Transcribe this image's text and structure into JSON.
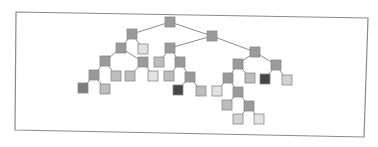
{
  "diagram": {
    "type": "binary-tree",
    "frame": {
      "corners": [
        [
          16,
          12
        ],
        [
          368,
          18
        ],
        [
          364,
          137
        ],
        [
          15,
          130
        ]
      ],
      "stroke": "#8a8a8a"
    },
    "node_size": 10,
    "edge_color": "#8c8c8c",
    "colors": {
      "medium": "#9a9a9a",
      "light_medium": "#bdbdbd",
      "light": "#d2d2d2",
      "lightest": "#e2e2e2",
      "dark_gray": "#7c7c7c",
      "dark": "#454545"
    },
    "nodes": [
      {
        "id": "n0",
        "x": 170,
        "y": 22,
        "shade": "medium"
      },
      {
        "id": "n1",
        "x": 132,
        "y": 34,
        "shade": "medium"
      },
      {
        "id": "n2",
        "x": 212,
        "y": 36,
        "shade": "medium"
      },
      {
        "id": "n3",
        "x": 121,
        "y": 48,
        "shade": "medium"
      },
      {
        "id": "n4",
        "x": 143,
        "y": 49,
        "shade": "lightest"
      },
      {
        "id": "n5",
        "x": 105,
        "y": 61,
        "shade": "medium"
      },
      {
        "id": "n6",
        "x": 143,
        "y": 62,
        "shade": "medium"
      },
      {
        "id": "n7",
        "x": 94,
        "y": 75,
        "shade": "medium"
      },
      {
        "id": "n8",
        "x": 116,
        "y": 76,
        "shade": "light_medium"
      },
      {
        "id": "n9",
        "x": 83,
        "y": 88,
        "shade": "dark_gray"
      },
      {
        "id": "n10",
        "x": 105,
        "y": 89,
        "shade": "light_medium"
      },
      {
        "id": "n11",
        "x": 130,
        "y": 76,
        "shade": "light_medium"
      },
      {
        "id": "n12",
        "x": 153,
        "y": 76,
        "shade": "lightest"
      },
      {
        "id": "n13",
        "x": 170,
        "y": 48,
        "shade": "medium"
      },
      {
        "id": "n14",
        "x": 159,
        "y": 62,
        "shade": "light_medium"
      },
      {
        "id": "n15",
        "x": 180,
        "y": 62,
        "shade": "medium"
      },
      {
        "id": "n16",
        "x": 169,
        "y": 76,
        "shade": "light_medium"
      },
      {
        "id": "n17",
        "x": 190,
        "y": 77,
        "shade": "medium"
      },
      {
        "id": "n18",
        "x": 178,
        "y": 90,
        "shade": "dark"
      },
      {
        "id": "n19",
        "x": 201,
        "y": 91,
        "shade": "light_medium"
      },
      {
        "id": "n20",
        "x": 255,
        "y": 52,
        "shade": "medium"
      },
      {
        "id": "n21",
        "x": 238,
        "y": 64,
        "shade": "medium"
      },
      {
        "id": "n22",
        "x": 276,
        "y": 65,
        "shade": "medium"
      },
      {
        "id": "n23",
        "x": 228,
        "y": 78,
        "shade": "medium"
      },
      {
        "id": "n24",
        "x": 250,
        "y": 78,
        "shade": "light_medium"
      },
      {
        "id": "n25",
        "x": 217,
        "y": 91,
        "shade": "lightest"
      },
      {
        "id": "n26",
        "x": 238,
        "y": 92,
        "shade": "medium"
      },
      {
        "id": "n27",
        "x": 227,
        "y": 105,
        "shade": "light_medium"
      },
      {
        "id": "n28",
        "x": 249,
        "y": 106,
        "shade": "medium"
      },
      {
        "id": "n29",
        "x": 238,
        "y": 119,
        "shade": "light"
      },
      {
        "id": "n30",
        "x": 259,
        "y": 119,
        "shade": "lightest"
      },
      {
        "id": "n31",
        "x": 265,
        "y": 79,
        "shade": "dark"
      },
      {
        "id": "n32",
        "x": 287,
        "y": 80,
        "shade": "light"
      }
    ],
    "edges": [
      [
        "n0",
        "n1"
      ],
      [
        "n0",
        "n2"
      ],
      [
        "n1",
        "n3"
      ],
      [
        "n1",
        "n4"
      ],
      [
        "n3",
        "n5"
      ],
      [
        "n3",
        "n6"
      ],
      [
        "n5",
        "n7"
      ],
      [
        "n5",
        "n8"
      ],
      [
        "n7",
        "n9"
      ],
      [
        "n7",
        "n10"
      ],
      [
        "n6",
        "n11"
      ],
      [
        "n6",
        "n12"
      ],
      [
        "n2",
        "n13"
      ],
      [
        "n2",
        "n20"
      ],
      [
        "n13",
        "n14"
      ],
      [
        "n13",
        "n15"
      ],
      [
        "n15",
        "n16"
      ],
      [
        "n15",
        "n17"
      ],
      [
        "n17",
        "n18"
      ],
      [
        "n17",
        "n19"
      ],
      [
        "n20",
        "n21"
      ],
      [
        "n20",
        "n22"
      ],
      [
        "n21",
        "n23"
      ],
      [
        "n21",
        "n24"
      ],
      [
        "n23",
        "n25"
      ],
      [
        "n23",
        "n26"
      ],
      [
        "n26",
        "n27"
      ],
      [
        "n26",
        "n28"
      ],
      [
        "n28",
        "n29"
      ],
      [
        "n28",
        "n30"
      ],
      [
        "n22",
        "n31"
      ],
      [
        "n22",
        "n32"
      ]
    ]
  }
}
